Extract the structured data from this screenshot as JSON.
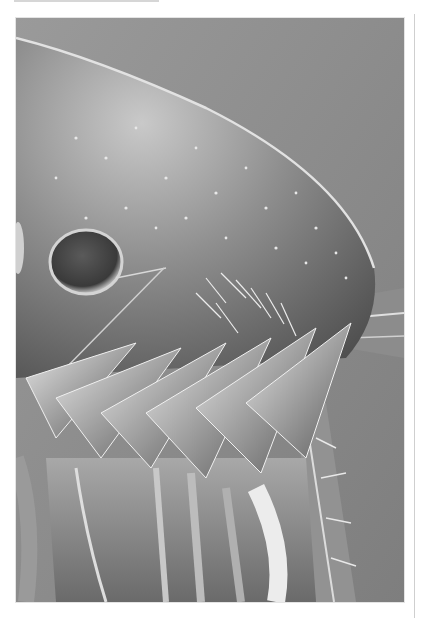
{
  "image": {
    "subject": "SEM micrograph of flea head",
    "colors": {
      "background": "#8a8a8a",
      "body_light": "#d8d8d8",
      "body_mid": "#9c9c9c",
      "body_dark": "#3a3a3a",
      "page": "#ffffff",
      "rule": "#cfcfcf"
    }
  }
}
